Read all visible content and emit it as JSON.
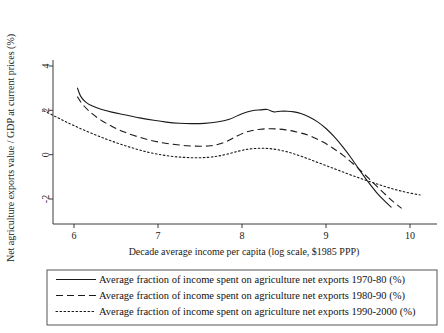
{
  "chart_data": {
    "type": "line",
    "title": "",
    "xlabel": "Decade average income per capita (log scale, $1985 PPP)",
    "ylabel": "Net agriculture exports value / GDP at current prices (%)",
    "xlim": [
      5.62,
      10.2
    ],
    "ylim": [
      -3.1,
      4.7
    ],
    "xticks": [
      6,
      7,
      8,
      9,
      10
    ],
    "yticks": [
      4,
      2,
      0,
      -2
    ],
    "xtick_labels": [
      "6",
      "7",
      "8",
      "9",
      "10"
    ],
    "ytick_labels": [
      "4",
      "2",
      "0",
      "-2"
    ],
    "grid": false,
    "legend_position": "below-axes",
    "series": [
      {
        "name": "Average fraction of income spent on agriculture net exports 1970-80 (%)",
        "label": "Average fraction of income spent on agriculture net exports 1970-80 (%)",
        "style": "solid",
        "dash": "none",
        "color": "#1a1a1a",
        "x": [
          6.04,
          6.08,
          6.14,
          6.22,
          6.32,
          6.45,
          6.6,
          6.78,
          6.95,
          7.1,
          7.25,
          7.4,
          7.55,
          7.7,
          7.85,
          8.0,
          8.12,
          8.22,
          8.3,
          8.38,
          8.46,
          8.54,
          8.62,
          8.7,
          8.8,
          8.9,
          9.0,
          9.1,
          9.2,
          9.3,
          9.4,
          9.5,
          9.6,
          9.7,
          9.78
        ],
        "y": [
          3.02,
          2.63,
          2.37,
          2.19,
          2.05,
          1.92,
          1.8,
          1.66,
          1.55,
          1.47,
          1.42,
          1.4,
          1.41,
          1.47,
          1.6,
          1.85,
          1.98,
          2.02,
          2.04,
          1.93,
          1.96,
          1.96,
          1.93,
          1.86,
          1.7,
          1.48,
          1.18,
          0.8,
          0.35,
          -0.15,
          -0.7,
          -1.22,
          -1.7,
          -2.1,
          -2.38
        ]
      },
      {
        "name": "Average fraction of income spent on agriculture net exports 1980-90 (%)",
        "label": "Average fraction of income spent on agriculture net exports 1980-90 (%)",
        "style": "dashed",
        "dash": "7,4",
        "color": "#1a1a1a",
        "x": [
          6.04,
          6.1,
          6.2,
          6.32,
          6.46,
          6.6,
          6.75,
          6.9,
          7.05,
          7.2,
          7.35,
          7.5,
          7.62,
          7.72,
          7.82,
          7.92,
          8.02,
          8.12,
          8.22,
          8.32,
          8.42,
          8.52,
          8.62,
          8.72,
          8.84,
          8.96,
          9.08,
          9.2,
          9.32,
          9.44,
          9.56,
          9.68,
          9.8,
          9.9
        ],
        "y": [
          2.62,
          2.28,
          1.9,
          1.56,
          1.26,
          1.02,
          0.82,
          0.66,
          0.54,
          0.46,
          0.4,
          0.38,
          0.4,
          0.47,
          0.6,
          0.8,
          0.98,
          1.09,
          1.15,
          1.17,
          1.16,
          1.12,
          1.05,
          0.96,
          0.8,
          0.58,
          0.3,
          -0.02,
          -0.4,
          -0.82,
          -1.26,
          -1.7,
          -2.12,
          -2.42
        ]
      },
      {
        "name": "Average fraction of income spent on agriculture net exports 1990-2000 (%)",
        "label": "Average fraction of income spent on agriculture net exports 1990-2000 (%)",
        "style": "dotted",
        "dash": "1.6,2.4",
        "color": "#1a1a1a",
        "x": [
          5.64,
          5.8,
          5.95,
          6.1,
          6.25,
          6.4,
          6.55,
          6.7,
          6.85,
          7.0,
          7.15,
          7.3,
          7.45,
          7.6,
          7.72,
          7.84,
          7.96,
          8.06,
          8.16,
          8.26,
          8.36,
          8.48,
          8.6,
          8.74,
          8.88,
          9.02,
          9.16,
          9.32,
          9.48,
          9.64,
          9.8,
          9.96,
          10.12
        ],
        "y": [
          1.98,
          1.68,
          1.4,
          1.14,
          0.9,
          0.68,
          0.48,
          0.3,
          0.14,
          0.02,
          -0.07,
          -0.12,
          -0.14,
          -0.12,
          -0.06,
          0.04,
          0.16,
          0.24,
          0.28,
          0.29,
          0.26,
          0.18,
          0.06,
          -0.12,
          -0.32,
          -0.52,
          -0.72,
          -0.95,
          -1.16,
          -1.36,
          -1.55,
          -1.7,
          -1.82
        ]
      }
    ]
  },
  "axes": {
    "y_axis_label": "Net agriculture exports value / GDP at current prices (%)",
    "x_axis_label": "Decade average income per capita (log scale, $1985 PPP)"
  },
  "legend": {
    "entries": [
      {
        "label": "Average fraction of income spent on agriculture net exports 1970-80 (%)",
        "style": "solid"
      },
      {
        "label": "Average fraction of income spent on agriculture net exports 1980-90 (%)",
        "style": "dashed"
      },
      {
        "label": "Average fraction of income spent on agriculture net exports 1990-2000 (%)",
        "style": "dotted"
      }
    ]
  }
}
